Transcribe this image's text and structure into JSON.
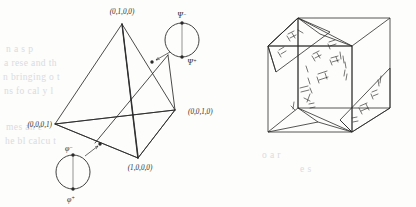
{
  "figure": {
    "ink_color": "#2b2b2b",
    "paper_color": "#fdfdfb",
    "bleed_color": "#d9dbe2"
  },
  "tetrahedron": {
    "name": "tetrahedron",
    "vertices": [
      {
        "id": "top",
        "label": "(0,1,0,0)",
        "x": 122,
        "y": 24,
        "label_x": 122,
        "label_y": 14
      },
      {
        "id": "left",
        "label": "(0,0,0,1)",
        "x": 55,
        "y": 124,
        "label_x": 30,
        "label_y": 127
      },
      {
        "id": "right",
        "label": "(0,0,1,0)",
        "x": 175,
        "y": 110,
        "label_x": 188,
        "label_y": 114
      },
      {
        "id": "bottom",
        "label": "(1,0,0,0)",
        "x": 138,
        "y": 158,
        "label_x": 140,
        "label_y": 170
      }
    ]
  },
  "circles": [
    {
      "id": "psi-circle",
      "cx": 182,
      "cy": 40,
      "r": 17,
      "top_label": "Ψ",
      "top_sup": "−",
      "bottom_label": "Ψ",
      "bottom_sup": "+",
      "top_label_x": 182,
      "top_label_y": 18,
      "bottom_label_x": 190,
      "bottom_label_y": 69,
      "arrow_from_x": 170,
      "arrow_from_y": 53,
      "arrow_to_x": 155,
      "arrow_to_y": 61,
      "marker_x": 152,
      "marker_y": 62
    },
    {
      "id": "phi-circle",
      "cx": 73,
      "cy": 172,
      "r": 17,
      "top_label": "φ",
      "top_sup": "−",
      "bottom_label": "φ",
      "bottom_sup": "+",
      "top_label_x": 69,
      "top_label_y": 150,
      "bottom_label_x": 71,
      "bottom_label_y": 202,
      "arrow_from_x": 84,
      "arrow_from_y": 157,
      "arrow_to_x": 97,
      "arrow_to_y": 146,
      "marker_x": 100,
      "marker_y": 144
    }
  ],
  "cube": {
    "name": "cube-with-planes",
    "front_face": {
      "x": 268,
      "y": 28,
      "w": 92,
      "h": 92
    },
    "depth_dx": 38,
    "depth_dy": -20,
    "hatch_note": "internal diagonal planes with hand-drawn hatch marks"
  },
  "background_text": [
    {
      "text": "n  a    s       p     ",
      "x": 6,
      "y": 44
    },
    {
      "text": "a   rese   and     th",
      "x": 4,
      "y": 58
    },
    {
      "text": "n  bringing       o  t",
      "x": 3,
      "y": 72
    },
    {
      "text": "ns  fo  cal      y    l",
      "x": 4,
      "y": 86
    },
    {
      "text": "mes   an    e   ",
      "x": 6,
      "y": 122
    },
    {
      "text": "he  bl   calcu   t  ",
      "x": 5,
      "y": 136
    },
    {
      "text": "o    a    r  ",
      "x": 262,
      "y": 150
    },
    {
      "text": "e  s    ",
      "x": 300,
      "y": 164
    }
  ]
}
